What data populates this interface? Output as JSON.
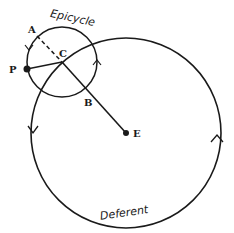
{
  "diagram": {
    "type": "ptolemaic-epicycle-model",
    "colors": {
      "ink": "#1a1a1a",
      "background": "#ffffff"
    },
    "labels": {
      "epicycle": "Epicycle",
      "deferent": "Deferent",
      "point_a": "A",
      "point_b": "B",
      "point_c": "C",
      "point_p": "P",
      "point_e": "E"
    },
    "elements": {
      "deferent_circle": {
        "cx": 126,
        "cy": 133,
        "r": 95
      },
      "epicycle_circle": {
        "cx": 62,
        "cy": 62,
        "r": 35
      },
      "earth_point": {
        "x": 126,
        "y": 133
      },
      "planet_point": {
        "x": 27,
        "y": 69
      },
      "line_ec": "E to C extended to B",
      "dashed_line_ac": "A to C",
      "line_pc": "P to C"
    }
  }
}
